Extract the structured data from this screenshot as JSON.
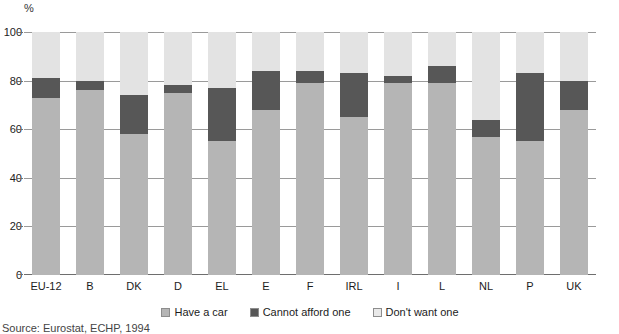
{
  "chart_data": {
    "type": "bar",
    "subtype": "stacked-bar-100",
    "title": "",
    "xlabel": "",
    "ylabel": "%",
    "ylim": [
      0,
      100
    ],
    "yticks": [
      0,
      20,
      40,
      60,
      80,
      100
    ],
    "grid": true,
    "legend_position": "bottom",
    "categories": [
      "EU-12",
      "B",
      "DK",
      "D",
      "EL",
      "E",
      "F",
      "IRL",
      "I",
      "L",
      "NL",
      "P",
      "UK"
    ],
    "series": [
      {
        "name": "Have a car",
        "color": "#b5b5b5",
        "values": [
          73,
          76,
          58,
          75,
          55,
          68,
          79,
          65,
          79,
          79,
          57,
          55,
          68
        ]
      },
      {
        "name": "Cannot afford one",
        "color": "#575757",
        "values": [
          8,
          4,
          16,
          3,
          22,
          16,
          5,
          18,
          3,
          7,
          7,
          28,
          12
        ]
      },
      {
        "name": "Don't want one",
        "color": "#e3e3e3",
        "values": [
          19,
          20,
          26,
          22,
          23,
          16,
          16,
          17,
          18,
          14,
          36,
          17,
          20
        ]
      }
    ],
    "cumulative_tops": [
      [
        73,
        81,
        100
      ],
      [
        76,
        80,
        100
      ],
      [
        58,
        74,
        100
      ],
      [
        75,
        78,
        100
      ],
      [
        55,
        77,
        100
      ],
      [
        68,
        84,
        100
      ],
      [
        79,
        84,
        100
      ],
      [
        65,
        83,
        100
      ],
      [
        79,
        82,
        100
      ],
      [
        79,
        86,
        100
      ],
      [
        57,
        64,
        100
      ],
      [
        55,
        83,
        100
      ],
      [
        68,
        80,
        100
      ]
    ],
    "source_note": "Source: Eurostat, ECHP, 1994"
  },
  "axis": {
    "unit": "%",
    "tick_100": "100",
    "tick_80": "80",
    "tick_60": "60",
    "tick_40": "40",
    "tick_20": "20",
    "tick_0": "0"
  },
  "legend": {
    "items": [
      {
        "label": "Have a car"
      },
      {
        "label": "Cannot afford one"
      },
      {
        "label": "Don't want one"
      }
    ]
  },
  "footer": {
    "source": "Source: Eurostat, ECHP, 1994"
  }
}
